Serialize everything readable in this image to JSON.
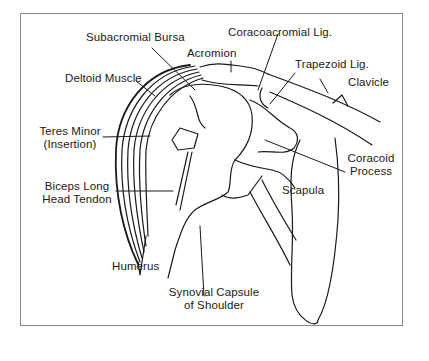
{
  "diagram": {
    "colors": {
      "ink": "#1a1a1a",
      "frame": "#8a8a8a",
      "background": "#ffffff"
    },
    "labels": [
      {
        "id": "subacromial-bursa",
        "lines": [
          "Subacromial Bursa"
        ]
      },
      {
        "id": "coracoacromial-lig",
        "lines": [
          "Coracoacromial Lig."
        ]
      },
      {
        "id": "acromion",
        "lines": [
          "Acromion"
        ]
      },
      {
        "id": "trapezoid-lig",
        "lines": [
          "Trapezoid Lig."
        ]
      },
      {
        "id": "deltoid-muscle",
        "lines": [
          "Deltoid Muscle"
        ]
      },
      {
        "id": "clavicle",
        "lines": [
          "Clavicle"
        ]
      },
      {
        "id": "teres-minor",
        "lines": [
          "Teres Minor",
          "(Insertion)"
        ]
      },
      {
        "id": "coracoid-process",
        "lines": [
          "Coracoid",
          "Process"
        ]
      },
      {
        "id": "scapula",
        "lines": [
          "Scapula"
        ]
      },
      {
        "id": "biceps-long-head-tendon",
        "lines": [
          "Biceps Long",
          "Head Tendon"
        ]
      },
      {
        "id": "humerus",
        "lines": [
          "Humerus"
        ]
      },
      {
        "id": "synovial-capsule",
        "lines": [
          "Synovial Capsule",
          "of Shoulder"
        ]
      }
    ]
  }
}
